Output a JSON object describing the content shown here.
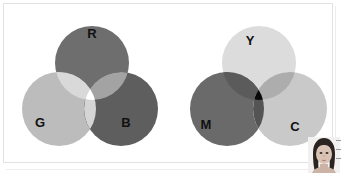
{
  "figure": {
    "background_color": "#ffffff",
    "border_color": "#e2e2e2"
  },
  "diagrams": [
    {
      "id": "additive-rgb",
      "model": "additive",
      "center_color": "#ffffff",
      "circles": [
        {
          "label": "R",
          "cx": 92,
          "cy": 63,
          "r": 37,
          "color": "#6e6e6e",
          "label_x": 92,
          "label_y": 33,
          "label_color": "#111111"
        },
        {
          "label": "G",
          "cx": 59,
          "cy": 109,
          "r": 37,
          "color": "#bcbcbc",
          "label_x": 40,
          "label_y": 122,
          "label_color": "#111111"
        },
        {
          "label": "B",
          "cx": 121,
          "cy": 109,
          "r": 37,
          "color": "#5e5e5e",
          "label_x": 126,
          "label_y": 122,
          "label_color": "#111111"
        }
      ]
    },
    {
      "id": "subtractive-cmy",
      "model": "subtractive",
      "center_color": "#0a0a0a",
      "circles": [
        {
          "label": "Y",
          "cx": 259,
          "cy": 63,
          "r": 37,
          "color": "#dcdcdc",
          "label_x": 250,
          "label_y": 40,
          "label_color": "#111111"
        },
        {
          "label": "M",
          "cx": 227,
          "cy": 109,
          "r": 37,
          "color": "#6a6a6a",
          "label_x": 206,
          "label_y": 124,
          "label_color": "#111111"
        },
        {
          "label": "C",
          "cx": 290,
          "cy": 109,
          "r": 37,
          "color": "#c9c9c9",
          "label_x": 295,
          "label_y": 126,
          "label_color": "#111111"
        }
      ]
    }
  ],
  "photo": {
    "alt": "person-portrait",
    "skin_color": "#d8c3b4",
    "hair_color": "#2b2320"
  }
}
